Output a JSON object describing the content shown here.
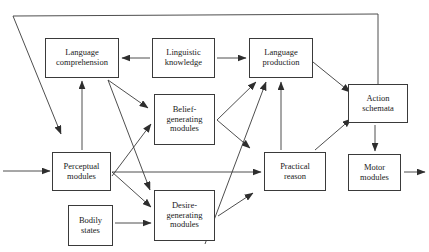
{
  "diagram": {
    "type": "box-and-arrow flowchart",
    "stroke_color": "#3a3a3a",
    "background_color": "#ffffff",
    "nodes": [
      {
        "id": "language-comprehension",
        "label": "Language\ncomprehension",
        "x": 45,
        "y": 38,
        "w": 74,
        "h": 40
      },
      {
        "id": "linguistic-knowledge",
        "label": "Linguistic\nknowledge",
        "x": 152,
        "y": 38,
        "w": 63,
        "h": 40
      },
      {
        "id": "language-production",
        "label": "Language\nproduction",
        "x": 249,
        "y": 38,
        "w": 64,
        "h": 40
      },
      {
        "id": "action-schemata",
        "label": "Action\nschemata",
        "x": 348,
        "y": 84,
        "w": 60,
        "h": 39
      },
      {
        "id": "belief-generating-modules",
        "label": "Belief-\ngenerating\nmodules",
        "x": 154,
        "y": 94,
        "w": 61,
        "h": 51
      },
      {
        "id": "perceptual-modules",
        "label": "Perceptual\nmodules",
        "x": 52,
        "y": 152,
        "w": 59,
        "h": 39
      },
      {
        "id": "practical-reason",
        "label": "Practical\nreason",
        "x": 264,
        "y": 152,
        "w": 62,
        "h": 39
      },
      {
        "id": "motor-modules",
        "label": "Motor\nmodules",
        "x": 348,
        "y": 154,
        "w": 53,
        "h": 37
      },
      {
        "id": "desire-generating-modules",
        "label": "Desire-\ngenerating\nmodules",
        "x": 154,
        "y": 190,
        "w": 61,
        "h": 51
      },
      {
        "id": "bodily-states",
        "label": "Bodily\nstates",
        "x": 68,
        "y": 205,
        "w": 45,
        "h": 41
      }
    ],
    "edges": [
      {
        "id": "input-to-perceptual",
        "from": "external-input",
        "to": "perceptual-modules"
      },
      {
        "id": "linguistic-to-comprehension",
        "from": "linguistic-knowledge",
        "to": "language-comprehension"
      },
      {
        "id": "linguistic-to-production",
        "from": "linguistic-knowledge",
        "to": "language-production"
      },
      {
        "id": "perceptual-to-comprehension",
        "from": "perceptual-modules",
        "to": "language-comprehension"
      },
      {
        "id": "comprehension-to-belief",
        "from": "language-comprehension",
        "to": "belief-generating-modules"
      },
      {
        "id": "comprehension-to-desire",
        "from": "language-comprehension",
        "to": "desire-generating-modules"
      },
      {
        "id": "perceptual-to-belief",
        "from": "perceptual-modules",
        "to": "belief-generating-modules"
      },
      {
        "id": "perceptual-to-desire",
        "from": "perceptual-modules",
        "to": "desire-generating-modules"
      },
      {
        "id": "perceptual-to-practical-reason",
        "from": "perceptual-modules",
        "to": "practical-reason"
      },
      {
        "id": "bodily-to-desire",
        "from": "bodily-states",
        "to": "desire-generating-modules"
      },
      {
        "id": "belief-to-production",
        "from": "belief-generating-modules",
        "to": "language-production"
      },
      {
        "id": "belief-to-practical-reason",
        "from": "belief-generating-modules",
        "to": "practical-reason"
      },
      {
        "id": "desire-to-production",
        "from": "desire-generating-modules",
        "to": "language-production"
      },
      {
        "id": "practical-reason-to-desire",
        "from": "practical-reason",
        "to": "desire-generating-modules"
      },
      {
        "id": "practical-reason-to-production",
        "from": "practical-reason",
        "to": "language-production"
      },
      {
        "id": "practical-reason-to-action",
        "from": "practical-reason",
        "to": "action-schemata"
      },
      {
        "id": "production-to-action",
        "from": "language-production",
        "to": "action-schemata"
      },
      {
        "id": "action-to-motor",
        "from": "action-schemata",
        "to": "motor-modules"
      },
      {
        "id": "motor-to-output",
        "from": "motor-modules",
        "to": "external-output"
      },
      {
        "id": "action-feedback-loop",
        "from": "action-schemata",
        "to": "perceptual-modules"
      }
    ]
  }
}
